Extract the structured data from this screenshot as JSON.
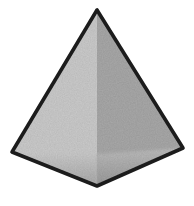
{
  "figure": {
    "name": "square pyramid illustration",
    "colors": {
      "background": "#ffffff",
      "left_face": "#c9c9c9",
      "right_face": "#a5a5a5",
      "base_left_top": "#cccccc",
      "base_left_bottom": "#a4a4a4",
      "base_right_top": "#bbbbbb",
      "base_right_bottom": "#949494",
      "outline": "#1c1c1c",
      "center_edge": "#2e2e2e"
    },
    "points": {
      "silhouette": "97,10 12,152 97,186 183,148",
      "left_face": "97,10 12,152 97,186",
      "right_face": "97,10 183,148 97,186",
      "base_left": "12,152 97,154 97,186",
      "base_right": "183,148 97,154 97,186",
      "center_edge": "97,10 97,186"
    }
  }
}
